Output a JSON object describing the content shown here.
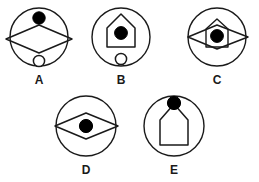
{
  "page": {
    "background_color": "#ffffff",
    "stroke_color": "#1a1a1a",
    "fill_color": "#000000",
    "hollow_fill": "#ffffff",
    "width": 259,
    "height": 182
  },
  "figures": [
    {
      "id": "A",
      "label": "A",
      "outer_shape": "circle",
      "elements": [
        {
          "name": "filled-dot",
          "position": "top",
          "fill": "#000000"
        },
        {
          "name": "wide-diamond",
          "position": "middle",
          "fill": "none",
          "note": "extends past circle left and right"
        },
        {
          "name": "hollow-circle",
          "position": "bottom",
          "fill": "#ffffff"
        }
      ],
      "left": 4,
      "top": 6,
      "width": 70,
      "height": 72
    },
    {
      "id": "B",
      "label": "B",
      "outer_shape": "circle",
      "elements": [
        {
          "name": "house-pentagon",
          "position": "middle",
          "fill": "none"
        },
        {
          "name": "filled-dot",
          "position": "inside-house",
          "fill": "#000000"
        },
        {
          "name": "hollow-circle",
          "position": "bottom",
          "fill": "#ffffff"
        }
      ],
      "left": 86,
      "top": 6,
      "width": 70,
      "height": 72
    },
    {
      "id": "C",
      "label": "C",
      "outer_shape": "circle",
      "elements": [
        {
          "name": "wide-diamond",
          "position": "middle",
          "fill": "none"
        },
        {
          "name": "house-pentagon",
          "position": "middle-overlap",
          "fill": "none"
        },
        {
          "name": "filled-dot",
          "position": "center",
          "fill": "#000000"
        }
      ],
      "left": 180,
      "top": 6,
      "width": 74,
      "height": 72
    },
    {
      "id": "D",
      "label": "D",
      "outer_shape": "circle",
      "elements": [
        {
          "name": "wide-diamond",
          "position": "middle",
          "fill": "none"
        },
        {
          "name": "filled-dot",
          "position": "center",
          "fill": "#000000"
        }
      ],
      "left": 48,
      "top": 94,
      "width": 76,
      "height": 80
    },
    {
      "id": "E",
      "label": "E",
      "outer_shape": "circle",
      "elements": [
        {
          "name": "house-pentagon",
          "position": "middle",
          "fill": "none"
        },
        {
          "name": "filled-dot",
          "position": "roof-apex",
          "fill": "#000000"
        }
      ],
      "left": 136,
      "top": 94,
      "width": 76,
      "height": 80
    }
  ]
}
